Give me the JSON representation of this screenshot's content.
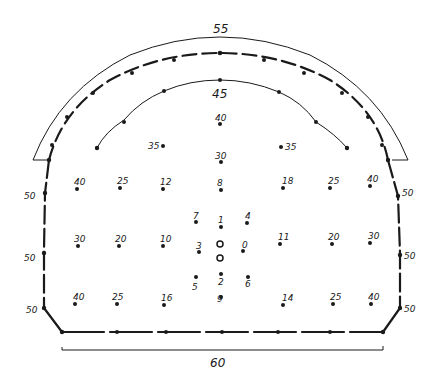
{
  "diagram": {
    "type": "tunnel-cross-section-blast-pattern",
    "colors": {
      "ink": "#1a1a1a",
      "background": "#ffffff"
    },
    "dimensions": {
      "arch_span_label": "55",
      "floor_width_label": "60"
    },
    "perimeter_labels": {
      "left_upper": "50",
      "left_middle": "50",
      "left_lower": "50",
      "right_upper": "50",
      "right_middle": "50",
      "right_lower": "50"
    },
    "inner_arc_labels": {
      "crown": "45",
      "center_top": "40",
      "left_35": "35",
      "right_35": "35",
      "center_30": "30"
    },
    "hole_rows": {
      "upper": [
        "40",
        "25",
        "12",
        "8",
        "18",
        "25",
        "40"
      ],
      "middle": [
        "30",
        "20",
        "10",
        "11",
        "20",
        "30"
      ],
      "lower": [
        "40",
        "25",
        "16",
        "14",
        "25",
        "40"
      ]
    },
    "cut_holes": {
      "top_left": "7",
      "top_center": "1",
      "top_right": "4",
      "mid_left": "3",
      "mid_right": "0",
      "bottom_left": "5",
      "bottom_center": "2",
      "bottom_right": "6",
      "bottom_lowest": "9"
    }
  }
}
